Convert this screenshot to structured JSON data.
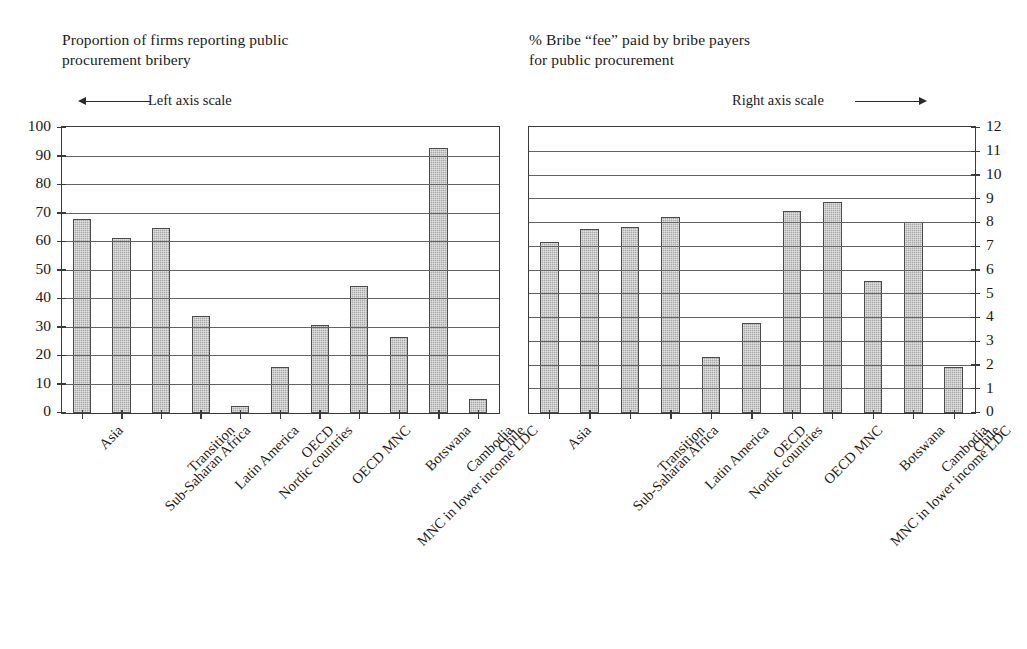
{
  "chart_data": [
    {
      "type": "bar",
      "panel": "left",
      "title": "Proportion of firms reporting public\nprocurement bribery",
      "scale_note": "Left axis scale",
      "scale_arrow": "arrow-left",
      "axis_side": "left",
      "xlabel": "",
      "ylabel": "",
      "ylim": [
        0,
        100
      ],
      "yticks": [
        0,
        10,
        20,
        30,
        40,
        50,
        60,
        70,
        80,
        90,
        100
      ],
      "ytick_labels": [
        "0",
        "10",
        "20",
        "30",
        "40",
        "50",
        "60",
        "70",
        "80",
        "90",
        "100"
      ],
      "grid": true,
      "legend": "none",
      "categories": [
        "Asia",
        "Sub-Saharan Africa",
        "Transition",
        "Latin America",
        "Nordic countries",
        "OECD",
        "OECD MNC",
        "MNC in lower income LDC",
        "Botswana",
        "Cambodia",
        "Chile"
      ],
      "values": [
        68,
        61.5,
        65,
        34,
        2.5,
        16,
        31,
        44.5,
        26.5,
        93,
        5
      ]
    },
    {
      "type": "bar",
      "panel": "right",
      "title": "% Bribe “fee” paid by bribe payers\nfor public procurement",
      "scale_note": "Right axis scale",
      "scale_arrow": "arrow-right",
      "axis_side": "right",
      "xlabel": "",
      "ylabel": "",
      "ylim": [
        0,
        12
      ],
      "yticks": [
        0,
        1,
        2,
        3,
        4,
        5,
        6,
        7,
        8,
        9,
        10,
        11,
        12
      ],
      "ytick_labels": [
        "0",
        "1",
        "2",
        "3",
        "4",
        "5",
        "6",
        "7",
        "8",
        "9",
        "10",
        "11",
        "12"
      ],
      "grid": true,
      "legend": "none",
      "categories": [
        "Asia",
        "Sub-Saharan Africa",
        "Transition",
        "Latin America",
        "Nordic countries",
        "OECD",
        "OECD MNC",
        "MNC in lower income LDC",
        "Botswana",
        "Cambodia",
        "Chile"
      ],
      "values": [
        7.2,
        7.75,
        7.85,
        8.25,
        2.35,
        3.8,
        8.5,
        8.9,
        5.55,
        8.05,
        1.95
      ]
    }
  ],
  "style": {
    "bar_fill": "#a9a9a9",
    "bar_stroke": "#4b4b4b",
    "grid_color": "#636363",
    "frame_color": "#3a3a3a",
    "text_color": "#1a1a1a",
    "background": "#ffffff"
  }
}
